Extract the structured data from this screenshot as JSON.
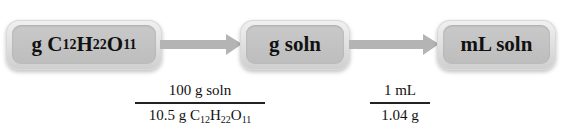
{
  "nodes": [
    {
      "id": "box1",
      "prefix": "g ",
      "formula": [
        [
          "C",
          "12"
        ],
        [
          "H",
          "22"
        ],
        [
          "O",
          "11"
        ]
      ],
      "label": "g C12H22O11"
    },
    {
      "id": "box2",
      "label": "g soln"
    },
    {
      "id": "box3",
      "label": "mL soln"
    }
  ],
  "node_labels": {
    "box1_prefix": "g ",
    "box1_C": "C",
    "box1_C_sub": "12",
    "box1_H": "H",
    "box1_H_sub": "22",
    "box1_O": "O",
    "box1_O_sub": "11",
    "box2": "g soln",
    "box3": "mL soln"
  },
  "conversion_factors": [
    {
      "numerator": "100 g soln",
      "denominator_prefix": "10.5 g ",
      "denominator_formula": {
        "C": "C",
        "C_sub": "12",
        "H": "H",
        "H_sub": "22",
        "O": "O",
        "O_sub": "11"
      },
      "denominator": "10.5 g C12H22O11"
    },
    {
      "numerator": "1 mL",
      "denominator": "1.04 g"
    }
  ],
  "colors": {
    "box_outer": "#d9d9d9",
    "box_inner": "#c4c4c4",
    "arrow": "#b4b4b4",
    "text": "#111111"
  }
}
